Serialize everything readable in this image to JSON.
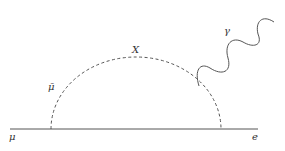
{
  "diagram": {
    "type": "feynman",
    "labels": {
      "incoming": "μ",
      "outgoing": "e",
      "loop_fermion": "μ̄",
      "loop_boson": "X",
      "photon": "γ"
    },
    "colors": {
      "line": "#555555",
      "text": "#333333"
    }
  }
}
